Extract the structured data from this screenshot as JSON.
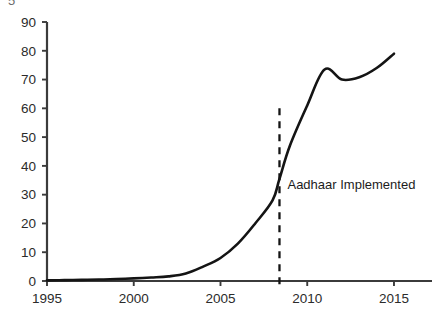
{
  "figure": {
    "clipped_top_text": "5",
    "background_color": "#ffffff",
    "line_color": "#141414",
    "axis_color": "#3b3b3b",
    "text_color": "#2b2b2b"
  },
  "annotation": {
    "label": "Aadhaar Implemented",
    "event_year": 2008.4,
    "line_top_value": 60,
    "label_value": 32,
    "label_x_offset": 8
  },
  "axes": {
    "y_ticks": [
      0,
      10,
      20,
      30,
      40,
      50,
      60,
      70,
      80,
      90
    ],
    "x_ticks": [
      1995,
      2000,
      2005,
      2010,
      2015
    ],
    "y_tick_labels": [
      "0",
      "10",
      "20",
      "30",
      "40",
      "50",
      "60",
      "70",
      "80",
      "90"
    ],
    "x_tick_labels": [
      "1995",
      "2000",
      "2005",
      "2010",
      "2015"
    ]
  },
  "chart_data": {
    "type": "line",
    "title": "",
    "subtitle": "",
    "xlabel": "",
    "ylabel": "",
    "xlim": [
      1995,
      2016.5
    ],
    "ylim": [
      0,
      90
    ],
    "grid": false,
    "legend": "none",
    "series": [
      {
        "name": "Value",
        "x": [
          1995,
          1996,
          1997,
          1998,
          1999,
          2000,
          2001,
          2002,
          2003,
          2004,
          2005,
          2006,
          2007,
          2008,
          2008.4,
          2009,
          2010,
          2011,
          2012,
          2013,
          2014,
          2015
        ],
        "values": [
          0.2,
          0.3,
          0.4,
          0.5,
          0.7,
          0.9,
          1.2,
          1.6,
          2.6,
          5.0,
          8.0,
          13.0,
          20.0,
          28.0,
          35.5,
          47.0,
          61.0,
          73.5,
          70.0,
          70.8,
          74.0,
          79.0
        ]
      }
    ],
    "annotations": [
      {
        "text": "Aadhaar Implemented",
        "x": 2008.4,
        "y": 32,
        "type": "vline-label"
      }
    ]
  }
}
